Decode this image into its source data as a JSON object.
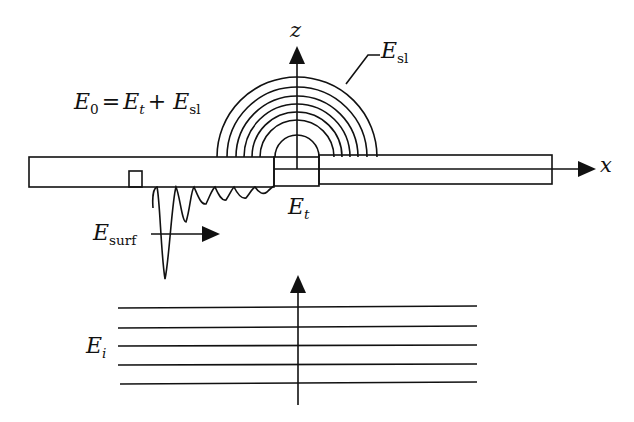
{
  "figure": {
    "type": "physics-schematic",
    "description_visible": "Slab waveguide with slit, scattered and surface fields under incident plane wave",
    "colors": {
      "stroke": "#111111",
      "background": "#ffffff"
    }
  },
  "axes": {
    "z_label": "z",
    "x_label": "x"
  },
  "labels": {
    "equation": {
      "lhs_main": "E",
      "lhs_sub": "0",
      "equals": "=",
      "t1_main": "E",
      "t1_sub": "t",
      "plus": "+",
      "t2_main": "E",
      "t2_sub": "sl"
    },
    "scattered": {
      "main": "E",
      "sub": "sl"
    },
    "transmitted": {
      "main": "E",
      "sub": "t"
    },
    "surface": {
      "main": "E",
      "sub": "surf"
    },
    "incident": {
      "main": "E",
      "sub": "i"
    }
  },
  "elements": {
    "arc_count": 7,
    "incident_wavefront_count": 5,
    "slab_segments": [
      "left-slab",
      "slit",
      "right-slab"
    ]
  }
}
